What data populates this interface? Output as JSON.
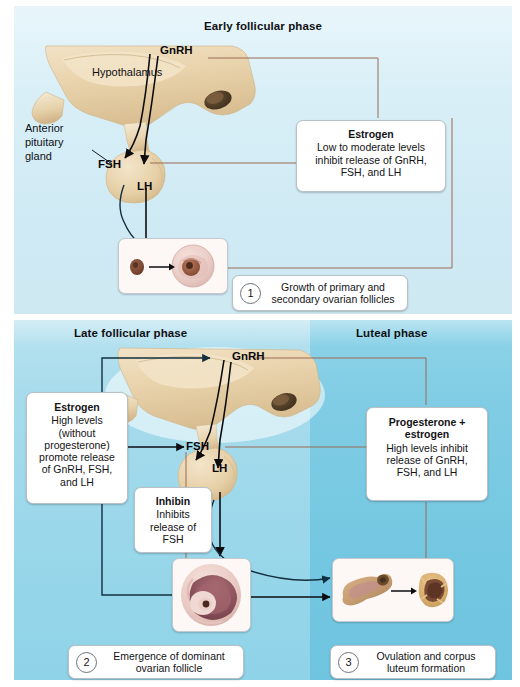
{
  "figure": {
    "palette": {
      "early_bg": "#d9eff7",
      "late_bg": "#a8dcec",
      "luteal_bg": "#7fcce4",
      "box_bg": "#ffffff",
      "box_border": "#b9c0c6",
      "arrow_dark": "#1d3b4a",
      "arrow_brown": "#9a6a55",
      "text": "#101014",
      "anatomy_tan": "#e8d2ae"
    }
  },
  "panels": {
    "early": {
      "title": "Early follicular phase",
      "anatomy": {
        "hypothalamus_label": "Hypothalamus",
        "pituitary_label_line1": "Anterior",
        "pituitary_label_line2": "pituitary",
        "pituitary_label_line3": "gland"
      },
      "hormones": {
        "gnrh": "GnRH",
        "fsh": "FSH",
        "lh": "LH"
      },
      "estrogen_box": {
        "title": "Estrogen",
        "body_line1": "Low to moderate levels",
        "body_line2": "inhibit release of GnRH,",
        "body_line3": "FSH, and LH"
      },
      "legend": {
        "number": "1",
        "line1": "Growth of primary and",
        "line2": "secondary ovarian follicles"
      },
      "specimen": {
        "left_caption": "primordial follicle",
        "right_caption": "secondary follicle"
      }
    },
    "late": {
      "title": "Late follicular phase",
      "hormones": {
        "gnrh": "GnRH",
        "fsh": "FSH",
        "lh": "LH"
      },
      "estrogen_box": {
        "title": "Estrogen",
        "body_line1": "High levels",
        "body_line2": "(without",
        "body_line3": "progesterone)",
        "body_line4": "promote release",
        "body_line5": "of GnRH, FSH,",
        "body_line6": "and LH"
      },
      "inhibin_box": {
        "title": "Inhibin",
        "body_line1": "Inhibits",
        "body_line2": "release of",
        "body_line3": "FSH"
      },
      "legend": {
        "number": "2",
        "line1": "Emergence of dominant",
        "line2": "ovarian follicle"
      },
      "specimen": {
        "caption": "dominant ovarian follicle"
      }
    },
    "luteal": {
      "title": "Luteal phase",
      "progesterone_box": {
        "title_line1": "Progesterone +",
        "title_line2": "estrogen",
        "body_line1": "High levels inhibit",
        "body_line2": "release of GnRH,",
        "body_line3": "FSH, and LH"
      },
      "legend": {
        "number": "3",
        "line1": "Ovulation and corpus",
        "line2": "luteum formation"
      },
      "specimen": {
        "left_caption": "ruptured follicle",
        "right_caption": "corpus luteum"
      }
    }
  }
}
